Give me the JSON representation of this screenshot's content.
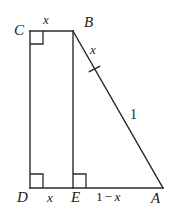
{
  "figure": {
    "caption": "",
    "stroke_color": "#2b2b2b",
    "background_color": "#ffffff",
    "vertices": {
      "C": "C",
      "B": "B",
      "D": "D",
      "E": "E",
      "A": "A"
    },
    "side_labels": {
      "top_CB": "x",
      "hyp_upper_BA": "x",
      "hyp_lower_BA": "1",
      "bottom_DE": "x",
      "bottom_EA_prefix": "1",
      "bottom_EA_minus": "−",
      "bottom_EA_suffix": "x",
      "bottom_EA_full": "1 − x"
    },
    "markers": {
      "right_angle_at_C": "right-angle",
      "right_angle_at_D": "right-angle",
      "right_angle_at_E": "right-angle",
      "tick_on_BA": "single-tick"
    },
    "geometry": {
      "C": [
        30,
        31
      ],
      "B": [
        73,
        31
      ],
      "D": [
        30,
        188
      ],
      "E": [
        73,
        188
      ],
      "A": [
        163,
        188
      ]
    }
  }
}
